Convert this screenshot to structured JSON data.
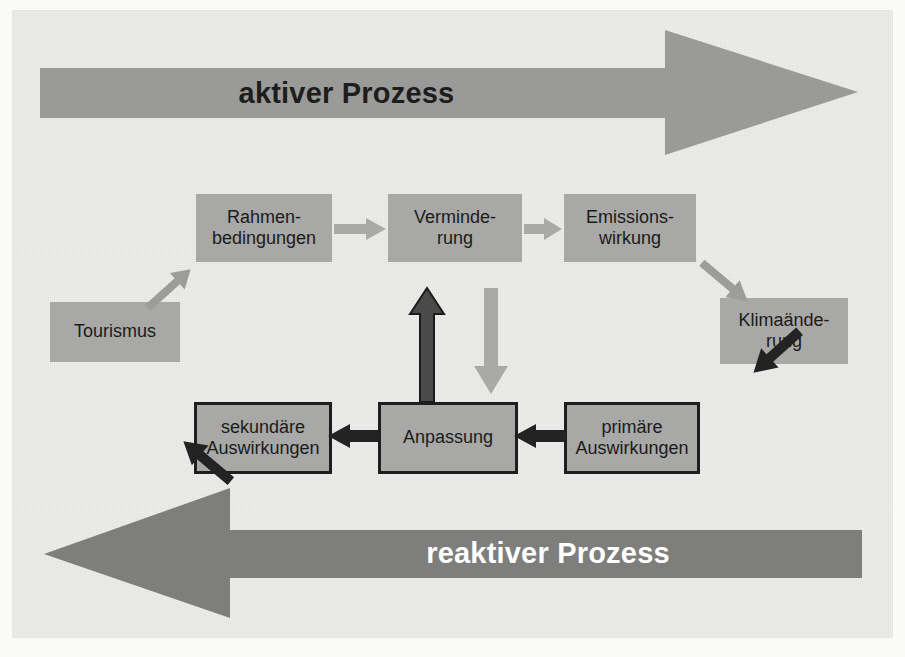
{
  "diagram": {
    "title_active": "aktiver Prozess",
    "title_reactive": "reaktiver Prozess",
    "colors": {
      "background": "#eeeeec",
      "box_fill": "#a8a8a6",
      "box_border": "#1e1e1e",
      "banner_active_fill": "#9a9a98",
      "banner_reactive_fill": "#7e7e7c",
      "arrow_light": "#a8a8a6",
      "arrow_dark": "#1e1e1e",
      "text_dark": "#1b1b1b",
      "text_light": "#ffffff"
    },
    "nodes": [
      {
        "id": "rahmenbedingungen",
        "label": "Rahmen-\nbedingungen",
        "style": "light"
      },
      {
        "id": "verminderung",
        "label": "Verminde-\nrung",
        "style": "light"
      },
      {
        "id": "emissionswirkung",
        "label": "Emissions-\nwirkung",
        "style": "light"
      },
      {
        "id": "klimaaenderung",
        "label": "Klimaände-\nrung",
        "style": "light"
      },
      {
        "id": "tourismus",
        "label": "Tourismus",
        "style": "light"
      },
      {
        "id": "primaere",
        "label": "primäre\nAuswirkungen",
        "style": "bordered"
      },
      {
        "id": "anpassung",
        "label": "Anpassung",
        "style": "bordered"
      },
      {
        "id": "sekundaere",
        "label": "sekundäre\nAuswirkungen",
        "style": "bordered"
      }
    ],
    "connectors": [
      {
        "id": "rahmen-to-verminderung",
        "from": "rahmenbedingungen",
        "to": "verminderung",
        "tone": "light"
      },
      {
        "id": "verminderung-to-emission",
        "from": "verminderung",
        "to": "emissionswirkung",
        "tone": "light"
      },
      {
        "id": "emission-to-klima",
        "from": "emissionswirkung",
        "to": "klimaaenderung",
        "tone": "light"
      },
      {
        "id": "klima-to-primaere",
        "from": "klimaaenderung",
        "to": "primaere",
        "tone": "dark"
      },
      {
        "id": "primaere-to-anpassung",
        "from": "primaere",
        "to": "anpassung",
        "tone": "dark"
      },
      {
        "id": "anpassung-to-sekundaere",
        "from": "anpassung",
        "to": "sekundaere",
        "tone": "dark"
      },
      {
        "id": "sekundaere-to-tourismus",
        "from": "sekundaere",
        "to": "tourismus",
        "tone": "dark"
      },
      {
        "id": "tourismus-to-rahmen",
        "from": "tourismus",
        "to": "rahmenbedingungen",
        "tone": "light"
      },
      {
        "id": "anpassung-to-verminderung",
        "from": "anpassung",
        "to": "verminderung",
        "tone": "dark"
      },
      {
        "id": "verminderung-to-anpassung",
        "from": "verminderung",
        "to": "anpassung",
        "tone": "light"
      }
    ]
  }
}
